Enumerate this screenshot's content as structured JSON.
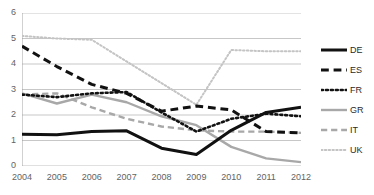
{
  "chart_data": {
    "type": "line",
    "title": "",
    "xlabel": "",
    "ylabel": "",
    "x": [
      2004,
      2005,
      2006,
      2007,
      2008,
      2009,
      2010,
      2011,
      2012
    ],
    "xtick_labels": [
      "2004",
      "2005",
      "2006",
      "2007",
      "2008",
      "2009",
      "2010",
      "2011",
      "2012"
    ],
    "ytick_labels": [
      "0",
      "1",
      "2",
      "3",
      "4",
      "5",
      "6"
    ],
    "yticks": [
      0,
      1,
      2,
      3,
      4,
      5,
      6
    ],
    "ylim": [
      0,
      6
    ],
    "xlim": [
      2004,
      2012
    ],
    "grid": "horizontal",
    "legend_position": "right",
    "series": [
      {
        "name": "DE",
        "label": "DE",
        "color": "#111111",
        "style": "solid",
        "values": [
          1.25,
          1.23,
          1.35,
          1.38,
          0.7,
          0.45,
          1.4,
          2.1,
          2.3
        ]
      },
      {
        "name": "ES",
        "label": "ES",
        "color": "#111111",
        "style": "dashed",
        "values": [
          4.7,
          3.9,
          3.2,
          2.85,
          2.15,
          2.35,
          2.2,
          1.35,
          1.3
        ]
      },
      {
        "name": "FR",
        "label": "FR",
        "color": "#111111",
        "style": "dotted",
        "values": [
          2.8,
          2.7,
          2.85,
          2.9,
          2.1,
          1.35,
          1.85,
          2.05,
          1.95
        ]
      },
      {
        "name": "GR",
        "label": "GR",
        "color": "#a8a8a8",
        "style": "solid",
        "values": [
          2.85,
          2.45,
          2.8,
          2.5,
          1.95,
          1.6,
          0.75,
          0.3,
          0.15
        ]
      },
      {
        "name": "IT",
        "label": "IT",
        "color": "#a8a8a8",
        "style": "dashed",
        "values": [
          2.8,
          2.85,
          2.3,
          1.85,
          1.55,
          1.4,
          1.35,
          1.35,
          1.3
        ]
      },
      {
        "name": "UK",
        "label": "UK",
        "color": "#c4c4c4",
        "style": "dotted",
        "values": [
          5.1,
          5.0,
          4.95,
          4.1,
          3.25,
          2.4,
          4.55,
          4.5,
          4.5
        ]
      }
    ]
  }
}
